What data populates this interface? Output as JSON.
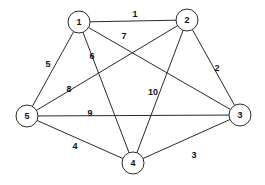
{
  "graph": {
    "type": "weighted-undirected-graph",
    "colors": {
      "stroke": "#2a2a2a",
      "background": "#ffffff",
      "text": "#111111"
    },
    "node_radius": 11,
    "nodes": [
      {
        "id": "1",
        "label": "1",
        "x": 79,
        "y": 22
      },
      {
        "id": "2",
        "label": "2",
        "x": 187,
        "y": 20
      },
      {
        "id": "3",
        "label": "3",
        "x": 240,
        "y": 115
      },
      {
        "id": "4",
        "label": "4",
        "x": 133,
        "y": 163
      },
      {
        "id": "5",
        "label": "5",
        "x": 27,
        "y": 116
      }
    ],
    "edges": [
      {
        "from": "1",
        "to": "2",
        "weight": "1",
        "lx": 135,
        "ly": 14
      },
      {
        "from": "2",
        "to": "3",
        "weight": "2",
        "lx": 217,
        "ly": 68
      },
      {
        "from": "3",
        "to": "4",
        "weight": "3",
        "lx": 194,
        "ly": 155
      },
      {
        "from": "4",
        "to": "5",
        "weight": "4",
        "lx": 75,
        "ly": 146
      },
      {
        "from": "5",
        "to": "1",
        "weight": "5",
        "lx": 48,
        "ly": 64
      },
      {
        "from": "1",
        "to": "4",
        "weight": "6",
        "lx": 92,
        "ly": 56
      },
      {
        "from": "1",
        "to": "3",
        "weight": "7",
        "lx": 124,
        "ly": 36
      },
      {
        "from": "2",
        "to": "5",
        "weight": "8",
        "lx": 69,
        "ly": 89
      },
      {
        "from": "5",
        "to": "3",
        "weight": "9",
        "lx": 90,
        "ly": 113
      },
      {
        "from": "2",
        "to": "4",
        "weight": "10",
        "lx": 153,
        "ly": 92
      }
    ]
  }
}
